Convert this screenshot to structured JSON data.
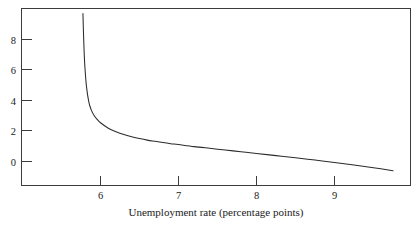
{
  "chart_data": {
    "type": "line",
    "title": "",
    "subtitle": "",
    "xlabel": "Unemployment rate (percentage points)",
    "ylabel": "",
    "xlim": [
      5.25,
      10.0
    ],
    "ylim": [
      -1.6,
      9.6
    ],
    "xticks": [
      6,
      7,
      8,
      9
    ],
    "xtick_labels": [
      "6",
      "7",
      "8",
      "9"
    ],
    "yticks": [
      0,
      2,
      4,
      6,
      8
    ],
    "ytick_labels": [
      "0",
      "2",
      "4",
      "6",
      "8"
    ],
    "grid": false,
    "legend": null,
    "annotations": [],
    "frame": "box",
    "tick_direction": "in",
    "series": [
      {
        "name": "Phillips curve",
        "asymptote_x": 5.77,
        "description": "Hyperbolic curve falling steeply from the top of the plot near the vertical asymptote, then flattening as the unemployment rate rises",
        "x": [
          5.775,
          5.78,
          5.79,
          5.8,
          5.82,
          5.85,
          5.88,
          5.92,
          5.96,
          6.0,
          6.1,
          6.2,
          6.3,
          6.4,
          6.5,
          6.6,
          6.7,
          6.8,
          6.9,
          7.0,
          7.2,
          7.4,
          7.6,
          7.8,
          8.0,
          8.25,
          8.5,
          8.75,
          9.0,
          9.25,
          9.5,
          9.75,
          10.0
        ],
        "y": [
          9.55,
          8.6,
          7.1,
          6.1,
          4.85,
          3.85,
          3.35,
          2.95,
          2.7,
          2.5,
          2.15,
          1.92,
          1.74,
          1.6,
          1.48,
          1.38,
          1.3,
          1.22,
          1.15,
          1.09,
          0.96,
          0.85,
          0.74,
          0.63,
          0.52,
          0.38,
          0.24,
          0.09,
          -0.06,
          -0.22,
          -0.4,
          -0.6,
          -0.86
        ]
      }
    ]
  },
  "axis": {
    "x_title": "Unemployment rate (percentage points)"
  }
}
